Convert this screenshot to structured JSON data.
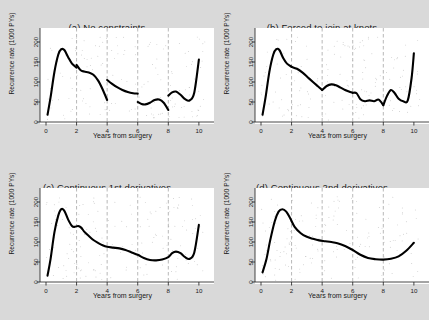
{
  "figure": {
    "background_color": "#d9d9d9",
    "panel_background_color": "#ffffff",
    "curve_color": "#000000",
    "knot_line_color": "#b0b0b0",
    "point_color": "#9a9a9a"
  },
  "panels": [
    {
      "id": "a",
      "title": "(a) No constraints"
    },
    {
      "id": "b",
      "title": "(b) Forced to join at knots"
    },
    {
      "id": "c",
      "title": "(c) Continuous 1st derivatives"
    },
    {
      "id": "d",
      "title": "(d) Continuous 2nd derivatives"
    }
  ],
  "axes": {
    "ylabel": "Recurrence rate (1000 PYs)",
    "xlabel": "Years from surgery",
    "yticks": [
      0,
      50,
      100,
      150,
      200
    ],
    "xticks": [
      0,
      2,
      4,
      6,
      8,
      10
    ],
    "xlim": [
      0,
      10.4
    ],
    "ylim": [
      0,
      215
    ],
    "knots": [
      2,
      4,
      6,
      8
    ]
  },
  "chart_data": [
    {
      "type": "line",
      "panel": "a",
      "title": "(a) No constraints",
      "xlabel": "Years from surgery",
      "ylabel": "Recurrence rate (1000 PYs)",
      "xlim": [
        0,
        10.4
      ],
      "ylim": [
        0,
        215
      ],
      "xticks": [
        0,
        2,
        4,
        6,
        8,
        10
      ],
      "yticks": [
        0,
        50,
        100,
        150,
        200
      ],
      "grid": false,
      "knots": [
        2,
        4,
        6,
        8
      ],
      "note": "Piecewise cubic with no continuity constraints: curve jumps at each knot",
      "segments": [
        {
          "x": [
            0.1,
            0.3,
            0.55,
            0.8,
            1.0,
            1.2,
            1.45,
            1.7,
            2.0
          ],
          "y": [
            18,
            62,
            125,
            168,
            182,
            180,
            162,
            146,
            136
          ]
        },
        {
          "x": [
            2.0,
            2.25,
            2.5,
            2.8,
            3.1,
            3.4,
            3.7,
            4.0
          ],
          "y": [
            143,
            130,
            126,
            124,
            118,
            104,
            82,
            55
          ]
        },
        {
          "x": [
            4.0,
            4.3,
            4.65,
            5.0,
            5.35,
            5.7,
            6.0
          ],
          "y": [
            105,
            96,
            87,
            80,
            75,
            72,
            71
          ]
        },
        {
          "x": [
            6.0,
            6.25,
            6.5,
            6.8,
            7.1,
            7.4,
            7.7,
            8.0
          ],
          "y": [
            50,
            45,
            44,
            48,
            55,
            56,
            48,
            30
          ]
        },
        {
          "x": [
            8.0,
            8.25,
            8.5,
            8.8,
            9.1,
            9.4,
            9.7,
            10.0
          ],
          "y": [
            66,
            74,
            76,
            68,
            57,
            54,
            74,
            156
          ]
        }
      ]
    },
    {
      "type": "line",
      "panel": "b",
      "title": "(b) Forced to join at knots",
      "xlabel": "Years from surgery",
      "ylabel": "Recurrence rate (1000 PYs)",
      "xlim": [
        0,
        10.4
      ],
      "ylim": [
        0,
        215
      ],
      "xticks": [
        0,
        2,
        4,
        6,
        8,
        10
      ],
      "yticks": [
        0,
        50,
        100,
        150,
        200
      ],
      "grid": false,
      "knots": [
        2,
        4,
        6,
        8
      ],
      "note": "Continuous at knots but with sharp corners (slope discontinuities)",
      "segments": [
        {
          "x": [
            0.1,
            0.3,
            0.55,
            0.8,
            1.0,
            1.2,
            1.45,
            1.7,
            2.0
          ],
          "y": [
            18,
            62,
            126,
            168,
            182,
            180,
            160,
            146,
            138
          ]
        },
        {
          "x": [
            2.0,
            2.35,
            2.7,
            3.05,
            3.4,
            3.7,
            4.0
          ],
          "y": [
            138,
            133,
            124,
            112,
            100,
            90,
            80
          ]
        },
        {
          "x": [
            4.0,
            4.3,
            4.6,
            4.9,
            5.2,
            5.5,
            5.75,
            6.0
          ],
          "y": [
            80,
            90,
            94,
            92,
            86,
            80,
            76,
            73
          ]
        },
        {
          "x": [
            6.0,
            6.25,
            6.5,
            6.8,
            7.1,
            7.4,
            7.7,
            8.0
          ],
          "y": [
            73,
            72,
            57,
            52,
            54,
            52,
            56,
            42
          ]
        },
        {
          "x": [
            8.0,
            8.25,
            8.5,
            8.75,
            9.0,
            9.3,
            9.6,
            9.85,
            10.0
          ],
          "y": [
            42,
            66,
            80,
            72,
            58,
            52,
            54,
            110,
            172
          ]
        }
      ]
    },
    {
      "type": "line",
      "panel": "c",
      "title": "(c) Continuous 1st derivatives",
      "xlabel": "Years from surgery",
      "ylabel": "Recurrence rate (1000 PYs)",
      "xlim": [
        0,
        10.4
      ],
      "ylim": [
        0,
        215
      ],
      "xticks": [
        0,
        2,
        4,
        6,
        8,
        10
      ],
      "yticks": [
        0,
        50,
        100,
        150,
        200
      ],
      "grid": false,
      "knots": [
        2,
        4,
        6,
        8
      ],
      "note": "Continuous value and first derivative; curvature may change at knots",
      "segments": [
        {
          "x": [
            0.1,
            0.3,
            0.55,
            0.8,
            1.0,
            1.2,
            1.45,
            1.7,
            1.9,
            2.1,
            2.3,
            2.5,
            2.8,
            3.1,
            3.4,
            3.7,
            4.0,
            4.4,
            4.8,
            5.2,
            5.6,
            6.0,
            6.4,
            6.8,
            7.2,
            7.6,
            8.0,
            8.25,
            8.5,
            8.8,
            9.1,
            9.4,
            9.7,
            10.0
          ],
          "y": [
            16,
            58,
            124,
            166,
            182,
            178,
            156,
            140,
            138,
            140,
            136,
            126,
            115,
            105,
            98,
            92,
            88,
            86,
            84,
            80,
            74,
            68,
            60,
            55,
            54,
            56,
            62,
            72,
            76,
            72,
            62,
            58,
            74,
            143
          ]
        }
      ]
    },
    {
      "type": "line",
      "panel": "d",
      "title": "(d) Continuous 2nd derivatives",
      "xlabel": "Years from surgery",
      "ylabel": "Recurrence rate (1000 PYs)",
      "xlim": [
        0,
        10.4
      ],
      "ylim": [
        0,
        215
      ],
      "xticks": [
        0,
        2,
        4,
        6,
        8,
        10
      ],
      "yticks": [
        0,
        50,
        100,
        150,
        200
      ],
      "grid": false,
      "knots": [
        2,
        4,
        6,
        8
      ],
      "note": "Natural cubic spline: smooth through all knots",
      "segments": [
        {
          "x": [
            0.1,
            0.35,
            0.6,
            0.9,
            1.15,
            1.4,
            1.65,
            1.9,
            2.2,
            2.6,
            3.0,
            3.4,
            3.8,
            4.2,
            4.6,
            5.0,
            5.5,
            6.0,
            6.5,
            7.0,
            7.5,
            8.0,
            8.5,
            9.0,
            9.5,
            10.0
          ],
          "y": [
            24,
            56,
            104,
            152,
            176,
            182,
            176,
            160,
            138,
            122,
            113,
            108,
            104,
            102,
            100,
            97,
            90,
            80,
            68,
            60,
            57,
            56,
            58,
            64,
            78,
            98
          ]
        }
      ]
    }
  ]
}
